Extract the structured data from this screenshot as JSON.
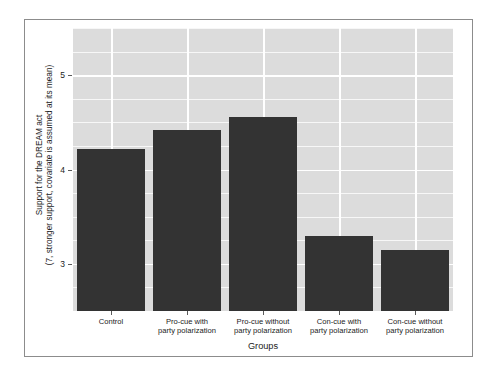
{
  "chart_data": {
    "type": "bar",
    "title": "",
    "subtitle": "",
    "xlabel": "Groups",
    "ylabel_line1": "Support for the DREAM act",
    "ylabel_line2": "(7, stronger support, covariate is assumed at its mean)",
    "categories": [
      "Control",
      "Pro-cue with party polarization",
      "Pro-cue without party polarization",
      "Con-cue with party polarization",
      "Con-cue without party polarization"
    ],
    "category_lines": [
      [
        "Control"
      ],
      [
        "Pro-cue with",
        "party polarization"
      ],
      [
        "Pro-cue without",
        "party polarization"
      ],
      [
        "Con-cue with",
        "party polarization"
      ],
      [
        "Con-cue without",
        "party polarization"
      ]
    ],
    "values": [
      4.22,
      4.42,
      4.56,
      3.3,
      3.15
    ],
    "ylim": [
      2.5,
      5.5
    ],
    "yticks": [
      3,
      4,
      5
    ],
    "ytick_labels": [
      "3",
      "4",
      "5"
    ],
    "grid": true,
    "grid_orientation": "both",
    "legend": "none",
    "bar_color": "#333333",
    "plot_background": "#dcdcdc",
    "gridline_color": "#ffffff",
    "figure_background": "#ffffff"
  }
}
